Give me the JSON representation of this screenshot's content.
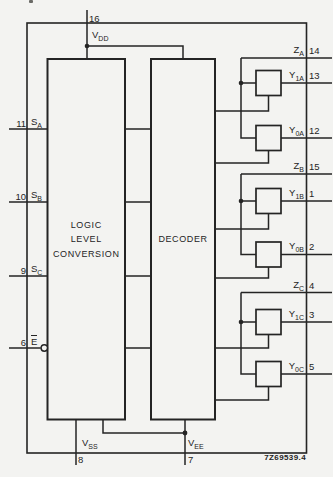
{
  "figure": {
    "code": "7Z69539.4",
    "ink": "#242424",
    "background": "#f3f3f1"
  },
  "blocks": {
    "llc": {
      "line1": "LOGIC",
      "line2": "LEVEL",
      "line3": "CONVERSION"
    },
    "decoder": {
      "label": "DECODER"
    }
  },
  "pins": {
    "vdd": {
      "number": "16",
      "base": "V",
      "sub": "DD"
    },
    "vss": {
      "number": "8",
      "base": "V",
      "sub": "SS"
    },
    "vee": {
      "number": "7",
      "base": "V",
      "sub": "EE"
    },
    "sa": {
      "number": "11",
      "base": "S",
      "sub": "A"
    },
    "sb": {
      "number": "10",
      "base": "S",
      "sub": "B"
    },
    "sc": {
      "number": "9",
      "base": "S",
      "sub": "C"
    },
    "e": {
      "number": "6",
      "base": "E"
    },
    "za": {
      "number": "14",
      "base": "Z",
      "sub": "A"
    },
    "y1a": {
      "number": "13",
      "base": "Y",
      "sub": "1A"
    },
    "y0a": {
      "number": "12",
      "base": "Y",
      "sub": "0A"
    },
    "zb": {
      "number": "15",
      "base": "Z",
      "sub": "B"
    },
    "y1b": {
      "number": "1",
      "base": "Y",
      "sub": "1B"
    },
    "y0b": {
      "number": "2",
      "base": "Y",
      "sub": "0B"
    },
    "zc": {
      "number": "4",
      "base": "Z",
      "sub": "C"
    },
    "y1c": {
      "number": "3",
      "base": "Y",
      "sub": "1C"
    },
    "y0c": {
      "number": "5",
      "base": "Y",
      "sub": "0C"
    }
  }
}
